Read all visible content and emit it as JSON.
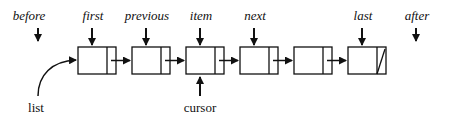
{
  "diagram": {
    "type": "linked-list",
    "pointer_labels": [
      {
        "id": "before",
        "text": "before",
        "x": 29
      },
      {
        "id": "first",
        "text": "first",
        "x": 93
      },
      {
        "id": "previous",
        "text": "previous",
        "x": 147
      },
      {
        "id": "item",
        "text": "item",
        "x": 201
      },
      {
        "id": "next",
        "text": "next",
        "x": 255
      },
      {
        "id": "last",
        "text": "last",
        "x": 363
      },
      {
        "id": "after",
        "text": "after",
        "x": 417
      }
    ],
    "nodes": [
      {
        "index": 0,
        "x": 78,
        "null_link": false
      },
      {
        "index": 1,
        "x": 132,
        "null_link": false
      },
      {
        "index": 2,
        "x": 186,
        "null_link": false
      },
      {
        "index": 3,
        "x": 240,
        "null_link": false
      },
      {
        "index": 4,
        "x": 294,
        "null_link": false
      },
      {
        "index": 5,
        "x": 348,
        "null_link": true
      }
    ],
    "list_label": "list",
    "cursor_label": "cursor",
    "colors": {
      "ink": "#111111",
      "background": "#ffffff"
    }
  }
}
